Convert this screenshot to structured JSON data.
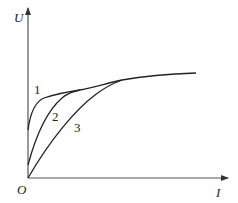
{
  "diagram": {
    "type": "U-I characteristic curves",
    "axes": {
      "y_label": "U",
      "x_label": "I",
      "origin_label": "O"
    },
    "curves": [
      {
        "label": "1",
        "description": "steepest rise from U-axis intercept, saturates first"
      },
      {
        "label": "2",
        "description": "intermediate rise from lower U-axis intercept"
      },
      {
        "label": "3",
        "description": "starts at origin, slowest rise, joins at highest I"
      }
    ],
    "colors": {
      "line": "#222222",
      "axis": "#555555",
      "background": "#ffffff"
    }
  }
}
